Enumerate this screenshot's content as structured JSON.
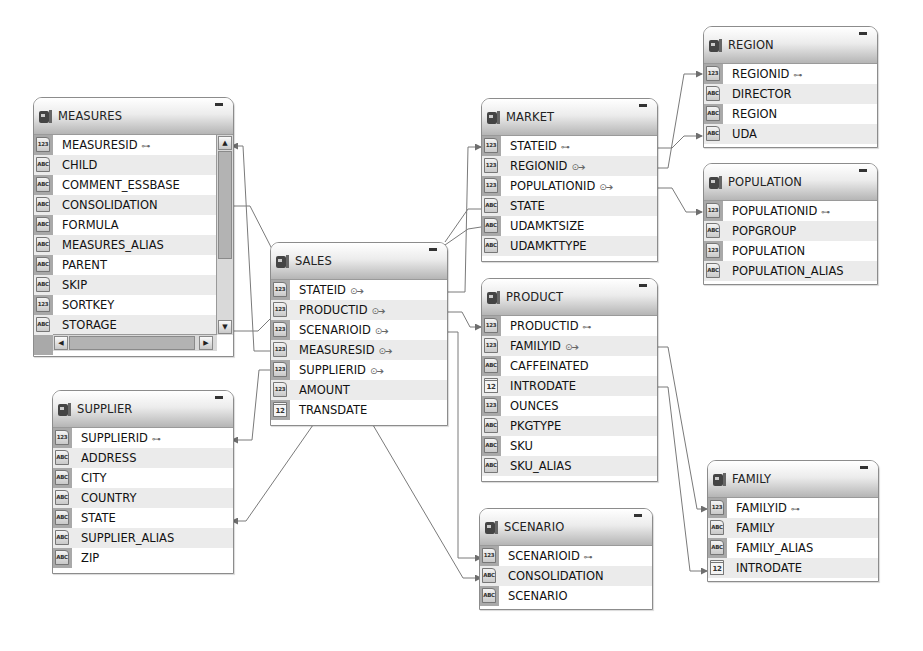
{
  "diagram": {
    "type": "database-schema",
    "tables": [
      {
        "id": "measures",
        "name": "MEASURES",
        "fields": [
          {
            "name": "MEASURESID",
            "type": "123",
            "key": "pk"
          },
          {
            "name": "CHILD",
            "type": "ABC"
          },
          {
            "name": "COMMENT_ESSBASE",
            "type": "ABC"
          },
          {
            "name": "CONSOLIDATION",
            "type": "ABC"
          },
          {
            "name": "FORMULA",
            "type": "ABC"
          },
          {
            "name": "MEASURES_ALIAS",
            "type": "ABC"
          },
          {
            "name": "PARENT",
            "type": "ABC"
          },
          {
            "name": "SKIP",
            "type": "ABC"
          },
          {
            "name": "SORTKEY",
            "type": "123"
          },
          {
            "name": "STORAGE",
            "type": "ABC"
          }
        ]
      },
      {
        "id": "sales",
        "name": "SALES",
        "fields": [
          {
            "name": "STATEID",
            "type": "123",
            "key": "fk"
          },
          {
            "name": "PRODUCTID",
            "type": "123",
            "key": "fk"
          },
          {
            "name": "SCENARIOID",
            "type": "123",
            "key": "fk"
          },
          {
            "name": "MEASURESID",
            "type": "123",
            "key": "fk"
          },
          {
            "name": "SUPPLIERID",
            "type": "123",
            "key": "fk"
          },
          {
            "name": "AMOUNT",
            "type": "123"
          },
          {
            "name": "TRANSDATE",
            "type": "DATE"
          }
        ]
      },
      {
        "id": "supplier",
        "name": "SUPPLIER",
        "fields": [
          {
            "name": "SUPPLIERID",
            "type": "123",
            "key": "pk"
          },
          {
            "name": "ADDRESS",
            "type": "ABC"
          },
          {
            "name": "CITY",
            "type": "ABC"
          },
          {
            "name": "COUNTRY",
            "type": "ABC"
          },
          {
            "name": "STATE",
            "type": "ABC"
          },
          {
            "name": "SUPPLIER_ALIAS",
            "type": "ABC"
          },
          {
            "name": "ZIP",
            "type": "ABC"
          }
        ]
      },
      {
        "id": "market",
        "name": "MARKET",
        "fields": [
          {
            "name": "STATEID",
            "type": "123",
            "key": "pk"
          },
          {
            "name": "REGIONID",
            "type": "123",
            "key": "fk"
          },
          {
            "name": "POPULATIONID",
            "type": "123",
            "key": "fk"
          },
          {
            "name": "STATE",
            "type": "ABC"
          },
          {
            "name": "UDAMKTSIZE",
            "type": "ABC"
          },
          {
            "name": "UDAMKTTYPE",
            "type": "ABC"
          }
        ]
      },
      {
        "id": "region",
        "name": "REGION",
        "fields": [
          {
            "name": "REGIONID",
            "type": "123",
            "key": "pk"
          },
          {
            "name": "DIRECTOR",
            "type": "ABC"
          },
          {
            "name": "REGION",
            "type": "ABC"
          },
          {
            "name": "UDA",
            "type": "ABC"
          }
        ]
      },
      {
        "id": "population",
        "name": "POPULATION",
        "fields": [
          {
            "name": "POPULATIONID",
            "type": "123",
            "key": "pk"
          },
          {
            "name": "POPGROUP",
            "type": "ABC"
          },
          {
            "name": "POPULATION",
            "type": "123"
          },
          {
            "name": "POPULATION_ALIAS",
            "type": "ABC"
          }
        ]
      },
      {
        "id": "product",
        "name": "PRODUCT",
        "fields": [
          {
            "name": "PRODUCTID",
            "type": "123",
            "key": "pk"
          },
          {
            "name": "FAMILYID",
            "type": "123",
            "key": "fk"
          },
          {
            "name": "CAFFEINATED",
            "type": "ABC"
          },
          {
            "name": "INTRODATE",
            "type": "DATE"
          },
          {
            "name": "OUNCES",
            "type": "123"
          },
          {
            "name": "PKGTYPE",
            "type": "ABC"
          },
          {
            "name": "SKU",
            "type": "ABC"
          },
          {
            "name": "SKU_ALIAS",
            "type": "ABC"
          }
        ]
      },
      {
        "id": "scenario",
        "name": "SCENARIO",
        "fields": [
          {
            "name": "SCENARIOID",
            "type": "123",
            "key": "pk"
          },
          {
            "name": "CONSOLIDATION",
            "type": "ABC"
          },
          {
            "name": "SCENARIO",
            "type": "ABC"
          }
        ]
      },
      {
        "id": "family",
        "name": "FAMILY",
        "fields": [
          {
            "name": "FAMILYID",
            "type": "123",
            "key": "pk"
          },
          {
            "name": "FAMILY",
            "type": "ABC"
          },
          {
            "name": "FAMILY_ALIAS",
            "type": "ABC"
          },
          {
            "name": "INTRODATE",
            "type": "DATE"
          }
        ]
      }
    ],
    "relationships": [
      {
        "from": "SALES.MEASURESID",
        "to": "MEASURES.MEASURESID"
      },
      {
        "from": "SALES.SUPPLIERID",
        "to": "SUPPLIER.SUPPLIERID"
      },
      {
        "from": "SALES.STATEID",
        "to": "MARKET.STATEID"
      },
      {
        "from": "SALES.PRODUCTID",
        "to": "PRODUCT.PRODUCTID"
      },
      {
        "from": "SALES.SCENARIOID",
        "to": "SCENARIO.SCENARIOID"
      },
      {
        "from": "MARKET.REGIONID",
        "to": "REGION.REGIONID"
      },
      {
        "from": "MARKET.POPULATIONID",
        "to": "POPULATION.POPULATIONID"
      },
      {
        "from": "PRODUCT.FAMILYID",
        "to": "FAMILY.FAMILYID"
      },
      {
        "from": "MEASURES.PARENT",
        "to": "MEASURES.CHILD"
      },
      {
        "from": "MEASURES.CONSOLIDATION",
        "to": "SCENARIO.CONSOLIDATION"
      },
      {
        "from": "MEASURES.STORAGE",
        "to": "MARKET.STATE"
      },
      {
        "from": "SALES.TRANSDATE",
        "to": "SUPPLIER.STATE"
      },
      {
        "from": "MARKET.UDAMKTSIZE",
        "to": "REGION.UDA"
      },
      {
        "from": "PRODUCT.INTRODATE",
        "to": "FAMILY.INTRODATE"
      }
    ]
  },
  "ui": {
    "minimize_glyph": "-",
    "pk_glyph": "⊶",
    "fk_glyph": "⊙➔",
    "scroll_up": "▲",
    "scroll_down": "▼",
    "scroll_left": "◀",
    "scroll_right": "▶"
  },
  "colors": {
    "header_top": "#ffffff",
    "header_bottom": "#b5b5b5",
    "row_alt": "#ebebeb",
    "border": "#8c8c8c",
    "link": "#6e6e6e"
  }
}
